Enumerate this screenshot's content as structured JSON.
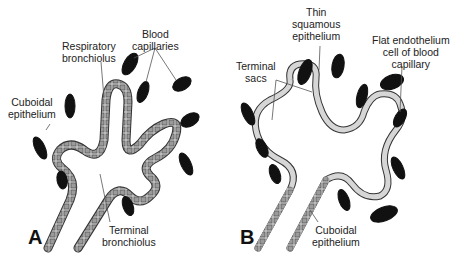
{
  "panels": {
    "A": {
      "letter": "A",
      "labels": {
        "respiratory_bronchiolus_1": "Respiratory",
        "respiratory_bronchiolus_2": "bronchiolus",
        "blood_capillaries_1": "Blood",
        "blood_capillaries_2": "capillaries",
        "cuboidal_epithelium_1": "Cuboidal",
        "cuboidal_epithelium_2": "epithelium",
        "terminal_bronchiolus_1": "Terminal",
        "terminal_bronchiolus_2": "bronchiolus"
      }
    },
    "B": {
      "letter": "B",
      "labels": {
        "thin_squamous_1": "Thin",
        "thin_squamous_2": "squamous",
        "thin_squamous_3": "epithelium",
        "flat_endothelium_1": "Flat endothelium",
        "flat_endothelium_2": "cell of blood",
        "flat_endothelium_3": "capillary",
        "terminal_sacs_1": "Terminal",
        "terminal_sacs_2": "sacs",
        "cuboidal_epithelium_1": "Cuboidal",
        "cuboidal_epithelium_2": "epithelium"
      }
    }
  },
  "colors": {
    "line": "#333333",
    "capillary": "#111111",
    "cell_fill": "#bdbdbd",
    "background": "#ffffff"
  }
}
